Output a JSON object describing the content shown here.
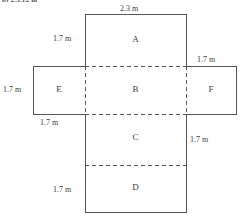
{
  "header": {
    "fragment_text": "b) 2.5.12 m"
  },
  "diagram": {
    "faces": [
      {
        "id": "A",
        "label": "A",
        "position": "top"
      },
      {
        "id": "B",
        "label": "B",
        "position": "center"
      },
      {
        "id": "C",
        "label": "C",
        "position": "lower-center"
      },
      {
        "id": "D",
        "label": "D",
        "position": "bottom"
      },
      {
        "id": "E",
        "label": "E",
        "position": "left"
      },
      {
        "id": "F",
        "label": "F",
        "position": "right"
      }
    ],
    "dimensions": [
      {
        "id": "top-width",
        "value": "2.3 m",
        "describes": "width of face A"
      },
      {
        "id": "a-height",
        "value": "1.7 m",
        "describes": "height of face A"
      },
      {
        "id": "e-height",
        "value": "1.7 m",
        "describes": "height of face E"
      },
      {
        "id": "e-width",
        "value": "1.7 m",
        "describes": "width of face E"
      },
      {
        "id": "f-width",
        "value": "1.7 m",
        "describes": "width of face F"
      },
      {
        "id": "c-height",
        "value": "1.7 m",
        "describes": "height of face C"
      },
      {
        "id": "d-height",
        "value": "1.7 m",
        "describes": "height of face D"
      }
    ],
    "colors": {
      "stroke": "#555555",
      "text": "#3a3a3a",
      "background": "#ffffff"
    }
  }
}
